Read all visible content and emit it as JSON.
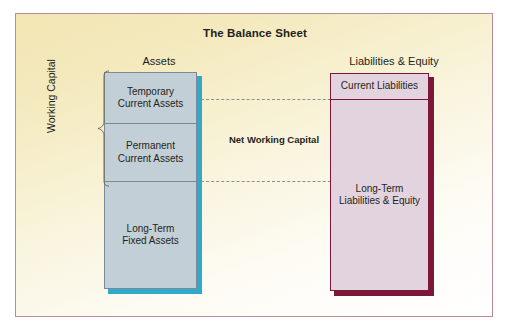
{
  "figure": {
    "title": "The Balance Sheet",
    "background_gradient_start": "#f2e6b4",
    "background_gradient_end": "#ffffff",
    "border_color": "#b98c95"
  },
  "assets_column": {
    "caption": "Assets",
    "fill_color": "#c3cfd6",
    "border_color": "#7b8b96",
    "shadow_color": "#31a9ca",
    "segments": [
      {
        "label": "Temporary\nCurrent Assets",
        "line1": "Temporary",
        "line2": "Current Assets"
      },
      {
        "label": "Permanent\nCurrent Assets",
        "line1": "Permanent",
        "line2": "Current Assets"
      },
      {
        "label": "Long-Term\nFixed Assets",
        "line1": "Long-Term",
        "line2": "Fixed Assets"
      }
    ]
  },
  "working_capital_brace": {
    "label": "Working Capital",
    "spans_segments": [
      "Temporary Current Assets",
      "Permanent Current Assets"
    ]
  },
  "net_working_capital": {
    "label": "Net Working Capital"
  },
  "liabilities_column": {
    "caption": "Liabilities & Equity",
    "fill_color": "#e3d3de",
    "border_color": "#7c1739",
    "shadow_color": "#7c1739",
    "segments": [
      {
        "label": "Current Liabilities",
        "line1": "Current Liabilities",
        "line2": ""
      },
      {
        "label": "Long-Term\nLiabilities & Equity",
        "line1": "Long-Term",
        "line2": "Liabilities & Equity"
      }
    ]
  }
}
